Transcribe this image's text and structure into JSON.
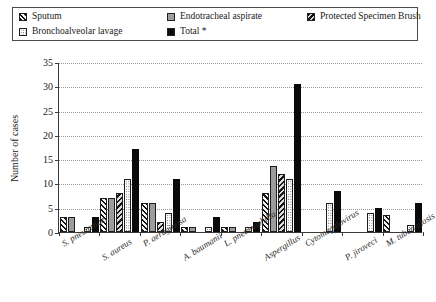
{
  "legend": {
    "items": [
      {
        "label": "Sputum",
        "icon": "hatch-swatch",
        "swatch": "sw-sputum"
      },
      {
        "label": "Endotracheal aspirate",
        "icon": "gray-swatch",
        "swatch": "sw-eta"
      },
      {
        "label": "Protected Specimen Brush",
        "icon": "back-hatch-swatch",
        "swatch": "sw-psb"
      },
      {
        "label": "Bronchoalveolar lavage",
        "icon": "dotted-swatch",
        "swatch": "sw-bal"
      },
      {
        "label": "Total *",
        "icon": "black-swatch",
        "swatch": "sw-total"
      }
    ]
  },
  "axes": {
    "ylabel": "Number of cases",
    "yticks": [
      0,
      5,
      10,
      15,
      20,
      25,
      30,
      35
    ]
  },
  "chart_data": {
    "type": "bar",
    "title": "",
    "xlabel": "",
    "ylabel": "Number of cases",
    "ylim": [
      0,
      35
    ],
    "ytick_step": 5,
    "grid": true,
    "legend_position": "top",
    "categories": [
      "S. pneumniae",
      "S. aureus",
      "P. aeruginosa",
      "A. baumanii",
      "L. pneumophilla",
      "Aspergillus",
      "Cytomegalovirus",
      "P. jiroveci",
      "M. tuberculosis"
    ],
    "series": [
      {
        "name": "Sputum",
        "values": [
          3,
          7,
          6,
          1,
          1,
          8,
          0,
          0,
          3.5
        ]
      },
      {
        "name": "Endotracheal aspirate",
        "values": [
          3,
          7,
          6,
          1,
          1,
          13.5,
          0,
          0,
          0
        ]
      },
      {
        "name": "Protected Specimen Brush",
        "values": [
          0,
          8,
          2,
          0,
          0,
          12,
          0,
          0,
          0
        ]
      },
      {
        "name": "Bronchoalveolar lavage",
        "values": [
          1,
          11,
          4,
          1,
          1,
          11,
          6,
          4,
          1.5
        ]
      },
      {
        "name": "Total *",
        "values": [
          3,
          17,
          11,
          3,
          2,
          30.5,
          8.5,
          5,
          6
        ]
      }
    ]
  }
}
